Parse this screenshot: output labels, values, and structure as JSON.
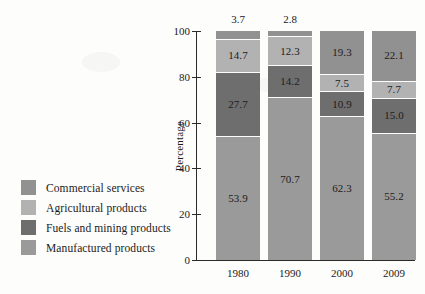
{
  "chart_data": {
    "type": "bar",
    "stacked": true,
    "title": "",
    "subtitle": "",
    "xlabel": "",
    "ylabel": "Percentage",
    "ylim": [
      0,
      100
    ],
    "yticks": [
      0,
      20,
      40,
      60,
      80,
      100
    ],
    "ytick_labels": [
      "0",
      "20",
      "40",
      "60",
      "80",
      "100"
    ],
    "grid": false,
    "legend_position": "left",
    "categories": [
      "1980",
      "1990",
      "2000",
      "2009"
    ],
    "series": [
      {
        "name": "Manufactured products",
        "color": "#9a9a9a",
        "values": [
          53.9,
          70.7,
          62.3,
          55.2
        ],
        "labels": [
          "53.9",
          "70.7",
          "62.3",
          "55.2"
        ]
      },
      {
        "name": "Fuels and mining products",
        "color": "#6e6e6e",
        "values": [
          27.7,
          14.2,
          10.9,
          15.0
        ],
        "labels": [
          "27.7",
          "14.2",
          "10.9",
          "15.0"
        ]
      },
      {
        "name": "Agricultural products",
        "color": "#b2b2b2",
        "values": [
          14.7,
          12.3,
          7.5,
          7.7
        ],
        "labels": [
          "14.7",
          "12.3",
          "7.5",
          "7.7"
        ]
      },
      {
        "name": "Commercial services",
        "color": "#919191",
        "values": [
          3.7,
          2.8,
          19.3,
          22.1
        ],
        "labels": [
          "3.7",
          "2.8",
          "19.3",
          "22.1"
        ],
        "labels_above_bar": [
          true,
          true,
          false,
          false
        ]
      }
    ]
  },
  "legend": {
    "items": [
      {
        "label": "Commercial services",
        "color": "#919191"
      },
      {
        "label": "Agricultural products",
        "color": "#b2b2b2"
      },
      {
        "label": "Fuels and mining products",
        "color": "#6e6e6e"
      },
      {
        "label": "Manufactured products",
        "color": "#9a9a9a"
      }
    ]
  },
  "axis": {
    "y_title": "Percentage"
  }
}
